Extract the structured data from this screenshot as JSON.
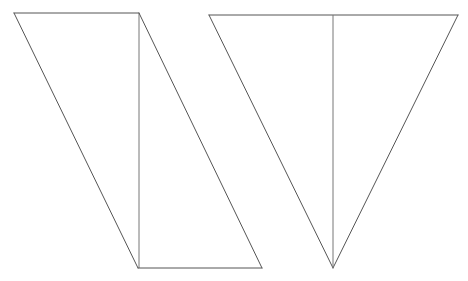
{
  "diagram": {
    "figures": [
      {
        "id": "left-figure",
        "kind": "parallelogram split by a vertical line into two right triangles",
        "edges": [
          "top",
          "left-diagonal",
          "vertical-divider",
          "right-diagonal",
          "bottom"
        ]
      },
      {
        "id": "right-figure",
        "kind": "inverted isosceles triangle split by a vertical median into two right triangles",
        "edges": [
          "top",
          "left-side",
          "right-side",
          "vertical-median"
        ]
      }
    ],
    "line_color": "#555555"
  }
}
